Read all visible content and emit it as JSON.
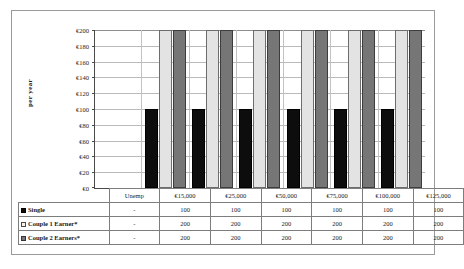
{
  "chart_data": {
    "type": "bar",
    "title": "",
    "subtitle": "",
    "xlabel": "",
    "ylabel": "per year",
    "ylim": [
      0,
      200
    ],
    "grid": true,
    "legend_position": "table-row-labels",
    "categories": [
      "Unemp",
      "€15,000",
      "€25,000",
      "€50,000",
      "€75,000",
      "€100,000",
      "€125,000"
    ],
    "y_ticks": [
      "€0",
      "€20",
      "€40",
      "€60",
      "€80",
      "€100",
      "€120",
      "€140",
      "€160",
      "€180",
      "€200"
    ],
    "y_tick_values": [
      0,
      20,
      40,
      60,
      80,
      100,
      120,
      140,
      160,
      180,
      200
    ],
    "series": [
      {
        "name": "Single",
        "color": "#0d0d0d",
        "values": [
          null,
          100,
          100,
          100,
          100,
          100,
          100
        ],
        "display_values": [
          "-",
          "100",
          "100",
          "100",
          "100",
          "100",
          "100"
        ]
      },
      {
        "name": "Couple 1 Earner*",
        "color": "#e3e3e3",
        "values": [
          null,
          200,
          200,
          200,
          200,
          200,
          200
        ],
        "display_values": [
          "-",
          "200",
          "200",
          "200",
          "200",
          "200",
          "200"
        ]
      },
      {
        "name": "Couple 2 Earners*",
        "color": "#767676",
        "values": [
          null,
          200,
          200,
          200,
          200,
          200,
          200
        ],
        "display_values": [
          "-",
          "200",
          "200",
          "200",
          "200",
          "200",
          "200"
        ]
      }
    ]
  },
  "axis": {
    "y_title": "per year",
    "ticks": [
      "€200",
      "€180",
      "€160",
      "€140",
      "€120",
      "€100",
      "€80",
      "€60",
      "€40",
      "€20",
      "€0"
    ]
  },
  "table": {
    "header": [
      "",
      "Unemp",
      "€15,000",
      "€25,000",
      "€50,000",
      "€75,000",
      "€100,000",
      "€125,000"
    ],
    "rows": [
      {
        "label": "Single",
        "swatch": "black-square-icon",
        "cells": [
          "-",
          "100",
          "100",
          "100",
          "100",
          "100",
          "100"
        ]
      },
      {
        "label": "Couple 1 Earner*",
        "swatch": "white-square-icon",
        "cells": [
          "-",
          "200",
          "200",
          "200",
          "200",
          "200",
          "200"
        ]
      },
      {
        "label": "Couple 2 Earners*",
        "swatch": "gray-square-icon",
        "cells": [
          "-",
          "200",
          "200",
          "200",
          "200",
          "200",
          "200"
        ]
      }
    ]
  },
  "colors": {
    "series_single": "#0d0d0d",
    "series_couple1": "#e3e3e3",
    "series_couple2": "#767676",
    "gridline": "#b9b9b9",
    "axis": "#4a4a4a",
    "frame": "#9a9a9a"
  }
}
